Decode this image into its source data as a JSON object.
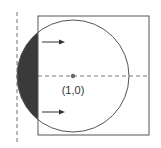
{
  "diagram": {
    "center_label": "(1,0)",
    "colors": {
      "line": "#555555",
      "shade": "#3a3a3a",
      "dashed": "#777777",
      "dot": "#666666",
      "background": "#ffffff"
    },
    "elements": {
      "square": "bounding square",
      "circle": "circle centered at (1,0)",
      "shaded_region": "circular segment left of square edge",
      "vertical_axis": "dashed vertical line tangent to circle",
      "horizontal_axis": "dashed horizontal line through center",
      "arrows": [
        "upper arrow pointing right",
        "lower arrow pointing right"
      ]
    }
  }
}
